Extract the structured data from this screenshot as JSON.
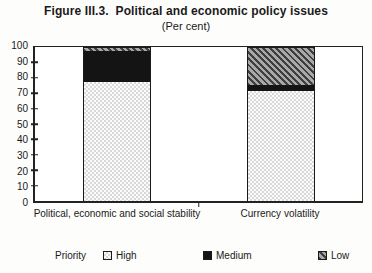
{
  "title": "Figure III.3.  Political and economic policy issues",
  "subtitle": "(Per cent)",
  "chart_data": {
    "type": "bar",
    "stacked": true,
    "orientation": "vertical",
    "categories": [
      "Political, economic and social stability",
      "Currency volatility"
    ],
    "series": [
      {
        "name": "High",
        "pattern": "dots",
        "color": "#f2f2f2",
        "values": [
          78,
          72
        ]
      },
      {
        "name": "Medium",
        "pattern": "solid",
        "color": "#141414",
        "values": [
          20,
          4
        ]
      },
      {
        "name": "Low",
        "pattern": "hatch",
        "color": "#9a9a9a",
        "values": [
          2,
          24
        ]
      }
    ],
    "ylim": [
      0,
      100
    ],
    "ytick_step": 10,
    "grid": false,
    "legend_prefix": "Priority",
    "legend_position": "bottom"
  }
}
